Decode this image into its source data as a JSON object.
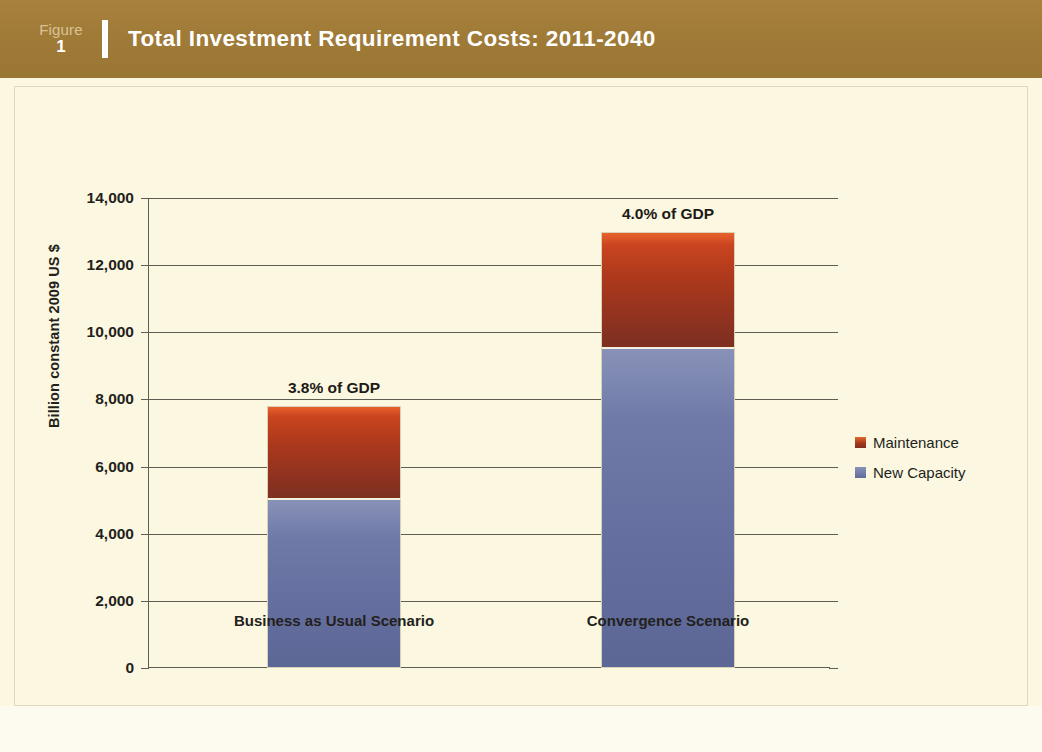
{
  "header": {
    "figure_word": "Figure",
    "figure_number": "1",
    "title": "Total Investment Requirement Costs: 2011-2040",
    "band_color": "#a07b38",
    "title_color": "#ffffff"
  },
  "source_note": {
    "label": "Source:",
    "text": " Kohli and Basil 2011"
  },
  "legend": {
    "items": [
      {
        "label": "Maintenance",
        "color": "#a6381c"
      },
      {
        "label": "New Capacity",
        "color": "#646f9f"
      }
    ]
  },
  "chart_data": {
    "type": "bar",
    "subtype": "stacked",
    "title": "Total Investment Requirement Costs: 2011-2040",
    "xlabel": "",
    "ylabel": "Billion constant 2009 US $",
    "ylim": [
      0,
      14000
    ],
    "ytick_labels": [
      "14,000",
      "12,000",
      "10,000",
      "8,000",
      "6,000",
      "4,000",
      "2,000",
      "0"
    ],
    "ytick_values": [
      14000,
      12000,
      10000,
      8000,
      6000,
      4000,
      2000,
      0
    ],
    "grid": true,
    "legend_position": "right",
    "categories": [
      "Business as Usual Scenario",
      "Convergence Scenario"
    ],
    "series": [
      {
        "name": "New Capacity",
        "color": "#646f9f",
        "values": [
          5050,
          9550
        ]
      },
      {
        "name": "Maintenance",
        "color": "#a6381c",
        "values": [
          2750,
          3450
        ]
      }
    ],
    "totals": [
      7800,
      13000
    ],
    "annotations": [
      "3.8% of GDP",
      "4.0% of GDP"
    ]
  }
}
